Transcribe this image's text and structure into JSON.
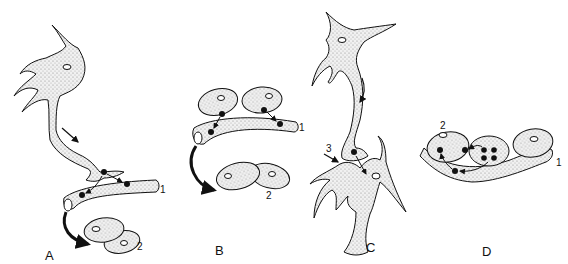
{
  "figure": {
    "type": "scientific-illustration",
    "panels": [
      {
        "id": "A",
        "label": "A",
        "numbers": [
          "1",
          "2"
        ],
        "description": "Neuron-like cell process contacting tubular structure (1); black particles transferred along tube; curved arrow toward paired oval cells (2)"
      },
      {
        "id": "B",
        "label": "B",
        "numbers": [
          "1",
          "2"
        ],
        "description": "Two oval cells above tube (1) releasing particles into it; curved arrow toward paired oval cells (2)"
      },
      {
        "id": "C",
        "label": "C",
        "numbers": [
          "3"
        ],
        "description": "Stellate cell process contacting a second stellate cell; arrow (3) indicates contact site"
      },
      {
        "id": "D",
        "label": "D",
        "numbers": [
          "1",
          "2"
        ],
        "description": "Cell containing four particles transferring particles to cell (2) and into tube (1)"
      }
    ]
  },
  "labels": {
    "A": "A",
    "B": "B",
    "C": "C",
    "D": "D",
    "a1": "1",
    "a2": "2",
    "b1": "1",
    "b2": "2",
    "c3": "3",
    "d1": "1",
    "d2": "2"
  },
  "colors": {
    "stroke": "#111111",
    "fill": "#e6e6e6",
    "background": "#ffffff"
  }
}
